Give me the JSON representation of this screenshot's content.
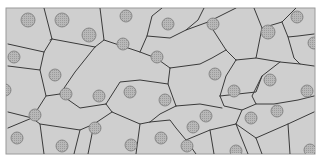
{
  "diagram": {
    "title": "",
    "colors": {
      "background": "#ffffff",
      "cell_fill": "#cfcfcf",
      "cell_border": "#3a3a3a",
      "nucleus_fill": "#b4b4b4",
      "nucleus_stroke": "#7a7a7a",
      "frame": "#9a9a9a"
    },
    "frame": {
      "x": 6,
      "y": 8,
      "width": 309,
      "height": 146
    },
    "nuclei": [
      {
        "x": 28,
        "y": 20,
        "r": 7
      },
      {
        "x": 62,
        "y": 20,
        "r": 7
      },
      {
        "x": 126,
        "y": 16,
        "r": 6
      },
      {
        "x": 89,
        "y": 35,
        "r": 7
      },
      {
        "x": 123,
        "y": 44,
        "r": 6
      },
      {
        "x": 168,
        "y": 24,
        "r": 6
      },
      {
        "x": 213,
        "y": 24,
        "r": 6
      },
      {
        "x": 268,
        "y": 32,
        "r": 7
      },
      {
        "x": 297,
        "y": 17,
        "r": 6
      },
      {
        "x": 314,
        "y": 43,
        "r": 6
      },
      {
        "x": 14,
        "y": 57,
        "r": 6
      },
      {
        "x": 55,
        "y": 75,
        "r": 6
      },
      {
        "x": 157,
        "y": 57,
        "r": 6
      },
      {
        "x": 215,
        "y": 74,
        "r": 6
      },
      {
        "x": 270,
        "y": 80,
        "r": 6
      },
      {
        "x": 307,
        "y": 91,
        "r": 6
      },
      {
        "x": 5,
        "y": 90,
        "r": 6
      },
      {
        "x": 35,
        "y": 115,
        "r": 6
      },
      {
        "x": 66,
        "y": 94,
        "r": 6
      },
      {
        "x": 99,
        "y": 96,
        "r": 6
      },
      {
        "x": 130,
        "y": 92,
        "r": 6
      },
      {
        "x": 165,
        "y": 100,
        "r": 6
      },
      {
        "x": 234,
        "y": 91,
        "r": 6
      },
      {
        "x": 206,
        "y": 116,
        "r": 6
      },
      {
        "x": 251,
        "y": 118,
        "r": 6
      },
      {
        "x": 277,
        "y": 111,
        "r": 6
      },
      {
        "x": 17,
        "y": 138,
        "r": 6
      },
      {
        "x": 62,
        "y": 146,
        "r": 6
      },
      {
        "x": 95,
        "y": 128,
        "r": 6
      },
      {
        "x": 131,
        "y": 145,
        "r": 6
      },
      {
        "x": 161,
        "y": 138,
        "r": 6
      },
      {
        "x": 193,
        "y": 127,
        "r": 6
      },
      {
        "x": 187,
        "y": 146,
        "r": 6
      },
      {
        "x": 236,
        "y": 151,
        "r": 6
      },
      {
        "x": 310,
        "y": 150,
        "r": 6
      },
      {
        "x": 76,
        "y": 95,
        "r": 0
      }
    ],
    "cell_borders": [
      "M44,8 L52,39 L50,40",
      "M52,39 L44,52 L40,70 L8,66",
      "M8,44 L44,52",
      "M52,39 L95,47",
      "M95,47 L104,40 L100,8",
      "M95,47 L75,72 L60,94",
      "M104,40 L140,52 L156,58 L170,68",
      "M140,52 L147,36 L152,16 L162,8",
      "M147,36 L170,38 L186,30 L208,22",
      "M186,30 L198,20 L204,8",
      "M208,22 L236,8",
      "M208,22 L226,50 L236,60",
      "M236,60 L256,58 L262,28 L254,8",
      "M256,58 L280,62 L300,64",
      "M262,28 L282,22 L296,8",
      "M282,22 L288,37 L298,36 L314,34",
      "M288,37 L294,58 L300,64 L314,66",
      "M236,60 L226,76 L220,96",
      "M220,96 L256,92 L262,76 L280,62",
      "M262,76 L252,96 L256,104 L274,104 L298,100 L314,96",
      "M220,96 L224,106 L242,110 L256,104",
      "M170,68 L200,64 L212,58 L226,50",
      "M170,68 L168,84 L176,106",
      "M176,106 L200,104 L222,108",
      "M176,106 L160,114 L150,122",
      "M40,70 L46,96 L60,94",
      "M60,94 L80,108 L106,104",
      "M106,104 L120,82 L140,80 L168,84",
      "M106,104 L112,112 L140,124 L150,122",
      "M150,122 L170,120 L176,128 L186,140",
      "M186,140 L210,130 L236,124 L242,110",
      "M236,124 L256,138 L262,154",
      "M236,124 L248,154",
      "M256,138 L288,124 L314,112",
      "M8,112 L32,118 L46,96",
      "M32,118 L40,124 L44,154",
      "M40,124 L80,130 L94,124 L112,112",
      "M94,124 L88,154",
      "M140,124 L136,154",
      "M186,140 L196,154",
      "M210,130 L214,154",
      "M288,124 L290,154",
      "M8,128 L32,118",
      "M80,130 L74,154"
    ]
  }
}
